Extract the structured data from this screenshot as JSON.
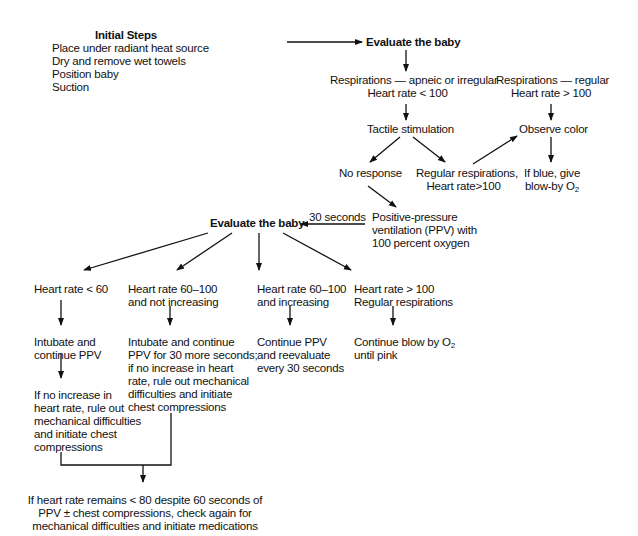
{
  "flowchart": {
    "initial_steps": {
      "title": "Initial Steps",
      "items": [
        "Place under radiant heat source",
        "Dry and remove wet towels",
        "Position baby",
        "Suction"
      ]
    },
    "evaluate_top": "Evaluate the baby",
    "resp_irregular": [
      "Respirations — apneic or irregular",
      "Heart rate < 100"
    ],
    "resp_regular": [
      "Respirations — regular",
      "Heart rate > 100"
    ],
    "tactile": "Tactile stimulation",
    "observe_color": "Observe color",
    "no_response": "No response",
    "regular_resp_hr": [
      "Regular respirations,",
      "Heart rate>100"
    ],
    "if_blue": [
      "If blue, give",
      "blow-by O",
      "2"
    ],
    "ppv": [
      "Positive-pressure",
      "ventilation (PPV) with",
      "100 percent oxygen"
    ],
    "thirty_seconds": "30 seconds",
    "evaluate_mid": "Evaluate the baby",
    "branches": [
      {
        "condition": [
          "Heart rate < 60"
        ],
        "action": [
          "Intubate and",
          "continue PPV"
        ],
        "followup": [
          "If no increase in",
          "heart rate, rule out",
          "mechanical difficulties",
          "and initiate chest",
          "compressions"
        ]
      },
      {
        "condition": [
          "Heart rate 60–100",
          "and not increasing"
        ],
        "action": [
          "Intubate and continue",
          "PPV for 30 more seconds;",
          "if no increase in heart",
          "rate, rule out mechanical",
          "difficulties and initiate",
          "chest compressions"
        ]
      },
      {
        "condition": [
          "Heart rate 60–100",
          "and increasing"
        ],
        "action": [
          "Continue PPV",
          "and reevaluate",
          "every 30 seconds"
        ]
      },
      {
        "condition": [
          "Heart rate > 100",
          "Regular respirations"
        ],
        "action": [
          "Continue blow by O",
          "2",
          "until pink"
        ]
      }
    ],
    "final": [
      "If heart rate remains < 80 despite 60 seconds of",
      "PPV ± chest compressions, check again for",
      "mechanical difficulties and initiate medications"
    ]
  },
  "colors": {
    "ink": "#111111",
    "background": "#ffffff"
  }
}
